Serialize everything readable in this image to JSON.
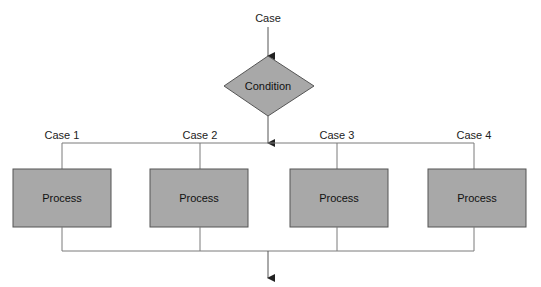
{
  "caption": "(Switch-case / multi-way selection structure)",
  "entry_label": "Case",
  "decision": {
    "label": "Condition",
    "color": "#a8a8a8"
  },
  "branches": [
    {
      "case_label": "Case 1",
      "process_label": "Process"
    },
    {
      "case_label": "Case 2",
      "process_label": "Process"
    },
    {
      "case_label": "Case 3",
      "process_label": "Process"
    },
    {
      "case_label": "Case 4",
      "process_label": "Process"
    }
  ],
  "colors": {
    "shape_fill": "#a8a8a8",
    "shape_stroke": "#555555",
    "connector": "#7a7a7a",
    "text": "#222222",
    "background": "#ffffff"
  }
}
